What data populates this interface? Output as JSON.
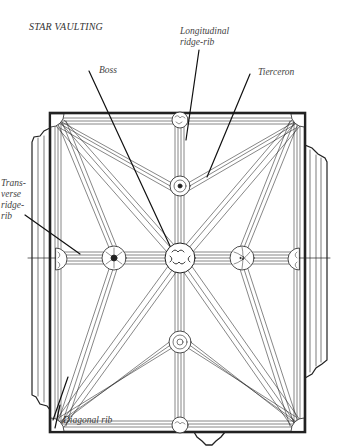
{
  "title": "STAR VAULTING",
  "labels": {
    "boss": "Boss",
    "longitudinal_line1": "Longitudinal",
    "longitudinal_line2": "ridge-rib",
    "tierceron": "Tierceron",
    "transverse_line1": "Trans-",
    "transverse_line2": "verse",
    "transverse_line3": "ridge-",
    "transverse_line4": "rib",
    "diagonal": "Diagonal rib"
  },
  "colors": {
    "ink": "#222222",
    "background": "#ffffff",
    "label_text": "#444444"
  },
  "components": [
    "boss",
    "longitudinal-ridge-rib",
    "tierceron",
    "transverse-ridge-rib",
    "diagonal-rib"
  ]
}
